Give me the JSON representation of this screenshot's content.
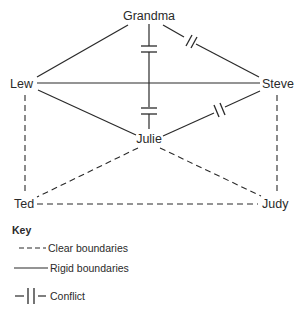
{
  "nodes": {
    "grandma": {
      "label": "Grandma"
    },
    "lew": {
      "label": "Lew"
    },
    "steve": {
      "label": "Steve"
    },
    "julie": {
      "label": "Julie"
    },
    "ted": {
      "label": "Ted"
    },
    "judy": {
      "label": "Judy"
    }
  },
  "edges": [
    {
      "from": "Grandma",
      "to": "Lew",
      "type": "rigid"
    },
    {
      "from": "Grandma",
      "to": "Steve",
      "type": "rigid",
      "conflict": true
    },
    {
      "from": "Grandma",
      "to": "Julie",
      "type": "rigid",
      "conflict": true
    },
    {
      "from": "Lew",
      "to": "Steve",
      "type": "rigid"
    },
    {
      "from": "Lew",
      "to": "Julie",
      "type": "rigid"
    },
    {
      "from": "Steve",
      "to": "Julie",
      "type": "rigid",
      "conflict": true
    },
    {
      "from": "Lew",
      "to": "Ted",
      "type": "clear"
    },
    {
      "from": "Steve",
      "to": "Judy",
      "type": "clear"
    },
    {
      "from": "Julie",
      "to": "Ted",
      "type": "clear"
    },
    {
      "from": "Julie",
      "to": "Judy",
      "type": "clear"
    },
    {
      "from": "Ted",
      "to": "Judy",
      "type": "clear"
    }
  ],
  "key": {
    "title": "Key",
    "items": [
      {
        "symbol": "dashed-line",
        "label": "Clear boundaries"
      },
      {
        "symbol": "solid-line",
        "label": "Rigid boundaries"
      },
      {
        "symbol": "conflict-bars",
        "label": "Conflict"
      }
    ]
  },
  "colors": {
    "line": "#2a2a2a",
    "background": "#ffffff"
  }
}
